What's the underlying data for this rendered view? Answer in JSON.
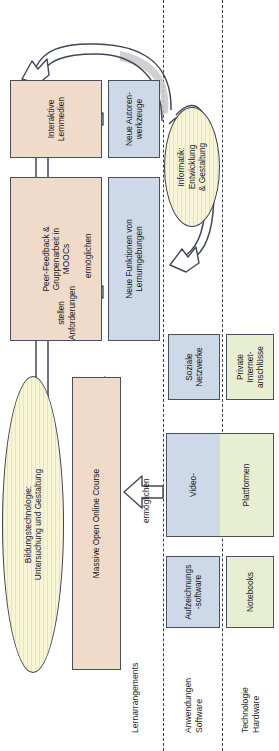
{
  "diagram": {
    "lanes": [
      {
        "id": "lernarrangements",
        "label": "Lernarrangements"
      },
      {
        "id": "anwendungen",
        "label": "Anwendungen\nSoftware"
      },
      {
        "id": "technologie",
        "label": "Technologie\nHardware"
      }
    ],
    "nodes": {
      "interaktive_lernmedien": {
        "label": "Interaktive\nLernmedien",
        "lane": "lernarrangements",
        "color": "#f0dbcb",
        "shape": "rect"
      },
      "peer_feedback": {
        "label": "Peer-Feedback &\nGruppenarbeit in\nMOOCs",
        "lane": "lernarrangements",
        "color": "#f0dbcb",
        "shape": "rect"
      },
      "mooc": {
        "label": "Massive Open Online Course",
        "lane": "lernarrangements",
        "color": "#f0dbcb",
        "shape": "rect"
      },
      "bildungstechnologie": {
        "label": "Bildungstechnologie:\nUntersuchung und Gestaltung",
        "lane": "lernarrangements",
        "color": "#f7f5d8",
        "shape": "ellipse"
      },
      "neue_autorenwerkzeuge": {
        "label": "Neue Autoren-\nwerkzeuge",
        "lane": "anwendungen",
        "color": "#cdd9e8",
        "shape": "rect"
      },
      "neue_funktionen": {
        "label": "Neue Funktionen von\nLernumgebungen",
        "lane": "anwendungen",
        "color": "#cdd9e8",
        "shape": "rect"
      },
      "informatik": {
        "label": "Informatik:\nEntwicklung\n& Gestaltung",
        "lane": "anwendungen",
        "color": "#f7f5d8",
        "shape": "ellipse"
      },
      "soziale_netzwerke": {
        "label": "Soziale\nNetzwerke",
        "lane": "anwendungen",
        "color": "#cdd9e8",
        "shape": "rect"
      },
      "aufzeichnungssoftware": {
        "label": "Aufzeichnungs\n-software",
        "lane": "anwendungen",
        "color": "#cdd9e8",
        "shape": "rect"
      },
      "private_internet": {
        "label": "Private\nInternet-\nanschlüsse",
        "lane": "technologie",
        "color": "#e8eed2",
        "shape": "rect"
      },
      "notebooks": {
        "label": "Notebooks",
        "lane": "technologie",
        "color": "#e8eed2",
        "shape": "rect"
      },
      "video_plattformen": {
        "label_top": "Video-",
        "label_bottom": "Plattformen",
        "lane": "anwendungen+technologie",
        "color_top": "#cdd9e8",
        "color_bottom": "#e8eed2",
        "shape": "split-rect"
      }
    },
    "edge_labels": {
      "ermoeglichen_top": "ermöglichen",
      "ermoeglichen_bottom": "ermöglichen",
      "stellen_anforderungen": "stellen\nAnforderungen"
    },
    "colors": {
      "peach": "#f0dbcb",
      "blue": "#cdd9e8",
      "green": "#e8eed2",
      "yellow": "#f7f5d8",
      "stroke": "#4a4f5c",
      "background": "#ffffff"
    }
  }
}
